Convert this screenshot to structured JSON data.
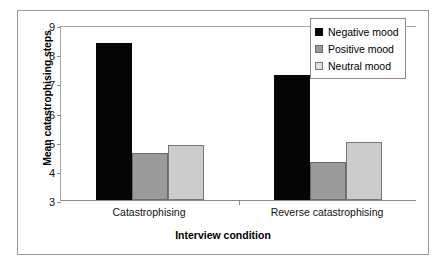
{
  "chart_data": {
    "type": "bar",
    "title": "",
    "xlabel": "Interview condition",
    "ylabel": "Mean catastrophising steps",
    "categories": [
      "Catastrophising",
      "Reverse catastrophising"
    ],
    "series": [
      {
        "name": "Negative mood",
        "values": [
          8.4,
          7.3
        ],
        "color": "#050505"
      },
      {
        "name": "Positive mood",
        "values": [
          4.6,
          4.3
        ],
        "color": "#9a9a9a"
      },
      {
        "name": "Neutral mood",
        "values": [
          4.9,
          5.0
        ],
        "color": "#cccccc"
      }
    ],
    "ylim": [
      3,
      9
    ],
    "yticks": [
      3,
      4,
      5,
      6,
      7,
      8,
      9
    ],
    "ytick_labels": [
      "3",
      "4",
      "5",
      "6",
      "7",
      "8",
      "9"
    ],
    "grid": false,
    "legend_position": "top-right",
    "bar_gap_within_group": 0,
    "frame": true
  },
  "legend": {
    "items": [
      {
        "label": "Negative mood",
        "swatch": "negative"
      },
      {
        "label": "Positive mood",
        "swatch": "positive"
      },
      {
        "label": "Neutral mood",
        "swatch": "neutral"
      }
    ]
  }
}
